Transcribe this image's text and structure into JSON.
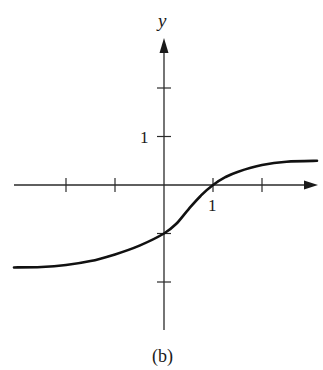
{
  "chart_data": {
    "type": "line",
    "title": "",
    "caption": "(b)",
    "xlabel": "",
    "ylabel": "y",
    "xlim": [
      -3.05,
      3.1
    ],
    "ylim": [
      -3.0,
      3.0
    ],
    "grid": false,
    "legend": null,
    "x_ticks": [
      -2,
      -1,
      1,
      2
    ],
    "x_tick_labels": [
      {
        "value": 1,
        "label": "1"
      }
    ],
    "y_ticks": [
      -2,
      -1,
      1,
      2
    ],
    "y_tick_labels": [
      {
        "value": 1,
        "label": "1"
      }
    ],
    "series": [
      {
        "name": "curve",
        "x": [
          -3.0,
          -2.5,
          -2.0,
          -1.5,
          -1.0,
          -0.5,
          0.0,
          0.25,
          0.5,
          0.75,
          1.0,
          1.25,
          1.5,
          2.0,
          2.5,
          3.0
        ],
        "y": [
          -1.7,
          -1.69,
          -1.65,
          -1.57,
          -1.43,
          -1.25,
          -1.0,
          -0.8,
          -0.5,
          -0.22,
          0.0,
          0.16,
          0.27,
          0.41,
          0.48,
          0.5
        ]
      }
    ],
    "asymptotes": {
      "left": -1.7,
      "right": 0.5
    }
  },
  "labels": {
    "y_axis": "y",
    "x_tick_one": "1",
    "y_tick_one": "1",
    "caption": "(b)"
  }
}
